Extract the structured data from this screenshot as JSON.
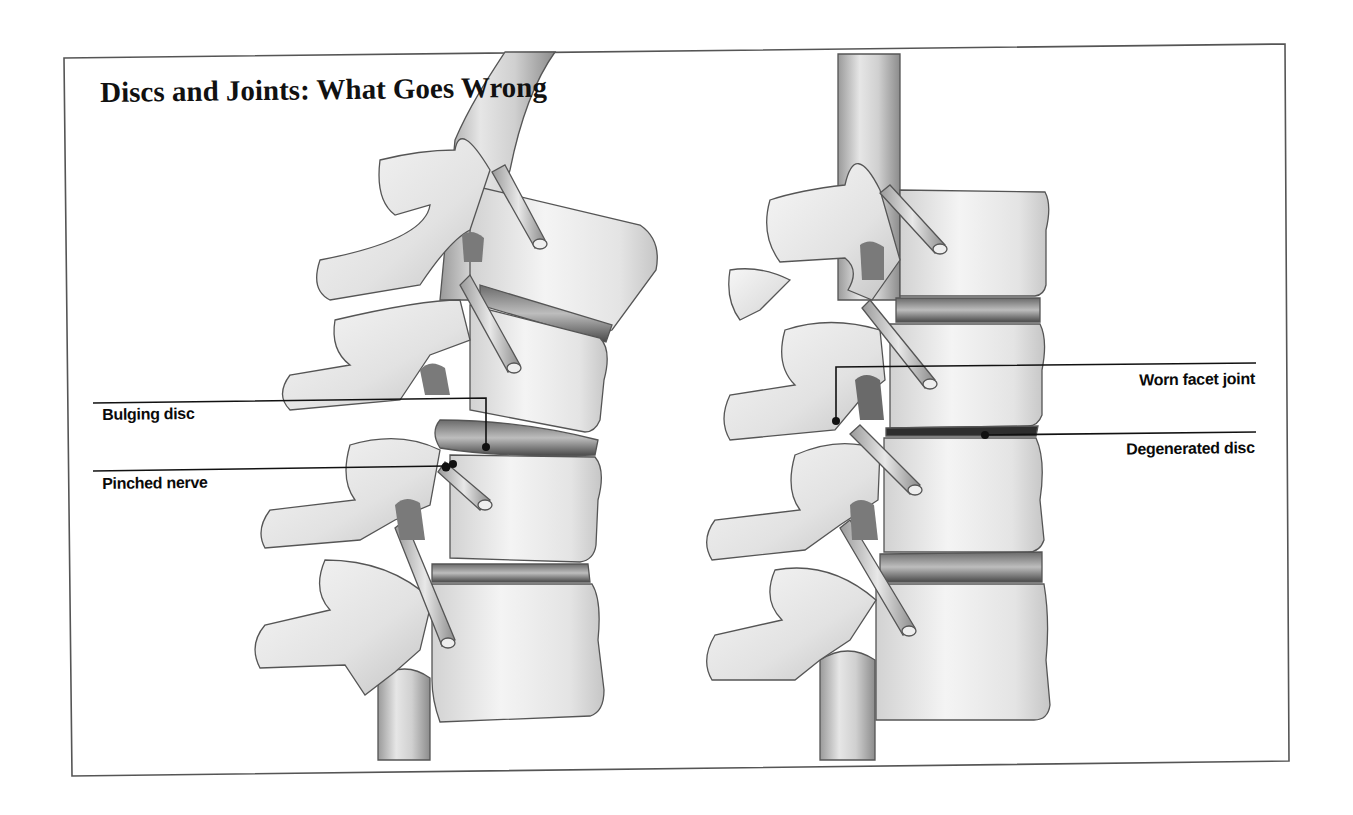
{
  "figure": {
    "title": "Discs and Joints: What Goes Wrong",
    "background_color": "#ffffff",
    "frame_color": "#555555",
    "panels": [
      {
        "name": "bulging-disc-spine",
        "callouts": [
          {
            "label": "Bulging disc",
            "points_to": "bulging intervertebral disc"
          },
          {
            "label": "Pinched nerve",
            "points_to": "compressed nerve root"
          }
        ]
      },
      {
        "name": "degenerated-spine",
        "callouts": [
          {
            "label": "Worn facet joint",
            "points_to": "facet joint"
          },
          {
            "label": "Degenerated disc",
            "points_to": "thinned intervertebral disc"
          }
        ]
      }
    ]
  },
  "labels": {
    "bulging_disc": "Bulging disc",
    "pinched_nerve": "Pinched nerve",
    "worn_facet_joint": "Worn facet joint",
    "degenerated_disc": "Degenerated disc"
  },
  "colors": {
    "bone_fill": "#eeeeee",
    "bone_shadow": "#bdbdbd",
    "outline": "#555555",
    "disc_dark": "#5a5a5a",
    "leader_line": "#111111"
  }
}
